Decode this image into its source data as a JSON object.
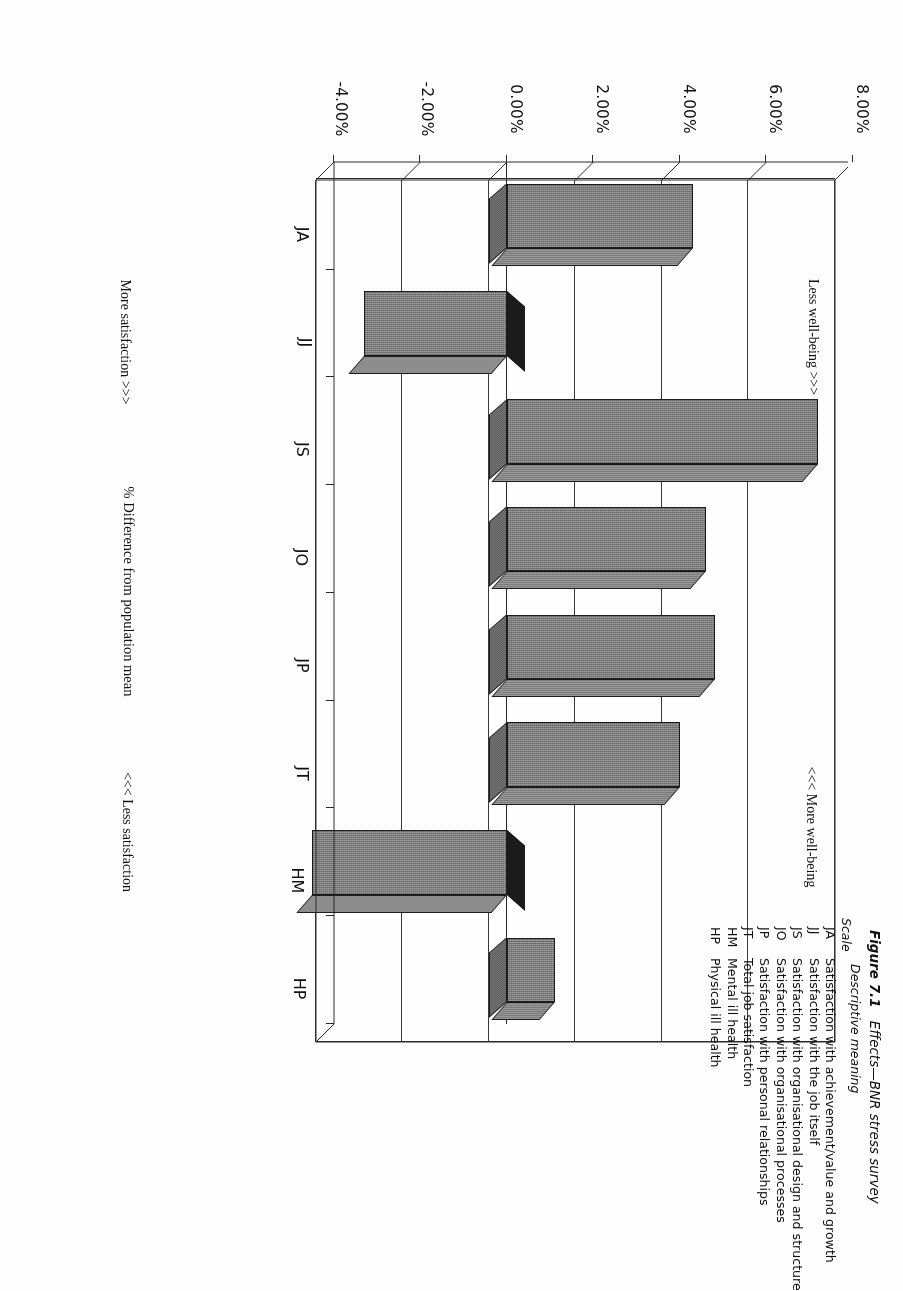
{
  "figure": {
    "number": "Figure 7.1",
    "title": "Effects—BNR stress survey"
  },
  "legend": {
    "scale_header": "Scale",
    "meaning_header": "Descriptive meaning",
    "rows": [
      {
        "code": "JA",
        "description": "Satisfaction with achievement/value and growth"
      },
      {
        "code": "JJ",
        "description": "Satisfaction with the job itself"
      },
      {
        "code": "JS",
        "description": "Satisfaction with organisational design and structure"
      },
      {
        "code": "JO",
        "description": "Satisfaction with organisational processes"
      },
      {
        "code": "JP",
        "description": "Satisfaction with personal relationships"
      },
      {
        "code": "JT",
        "description": "Total job satisfaction"
      },
      {
        "code": "HM",
        "description": "Mental ill health"
      },
      {
        "code": "HP",
        "description": "Physical ill health"
      }
    ]
  },
  "annotations": {
    "top_left": "Less well-being >>>",
    "top_right": "<<< More well-being",
    "bottom_left": "More satisfaction >>>",
    "bottom_right": "<<< Less satisfaction"
  },
  "chart_data": {
    "type": "bar",
    "orientation": "horizontal",
    "title": "Effects—BNR stress survey",
    "xlabel": "% Difference from population mean",
    "ylabel": "",
    "categories": [
      "JA",
      "JJ",
      "JS",
      "JO",
      "JP",
      "JT",
      "HM",
      "HP"
    ],
    "values": [
      4.3,
      -3.3,
      7.2,
      4.6,
      4.8,
      4.0,
      -4.5,
      1.1
    ],
    "tick_labels": [
      "8.00%",
      "6.00%",
      "4.00%",
      "2.00%",
      "0.00%",
      "-2.00%",
      "-4.00%"
    ],
    "tick_values": [
      8,
      6,
      4,
      2,
      0,
      -2,
      -4
    ],
    "xlim": [
      -4,
      8
    ],
    "grid": true,
    "legend": "none",
    "series": [
      {
        "name": "% Difference from population mean",
        "values": [
          4.3,
          -3.3,
          7.2,
          4.6,
          4.8,
          4.0,
          -4.5,
          1.1
        ]
      }
    ]
  }
}
